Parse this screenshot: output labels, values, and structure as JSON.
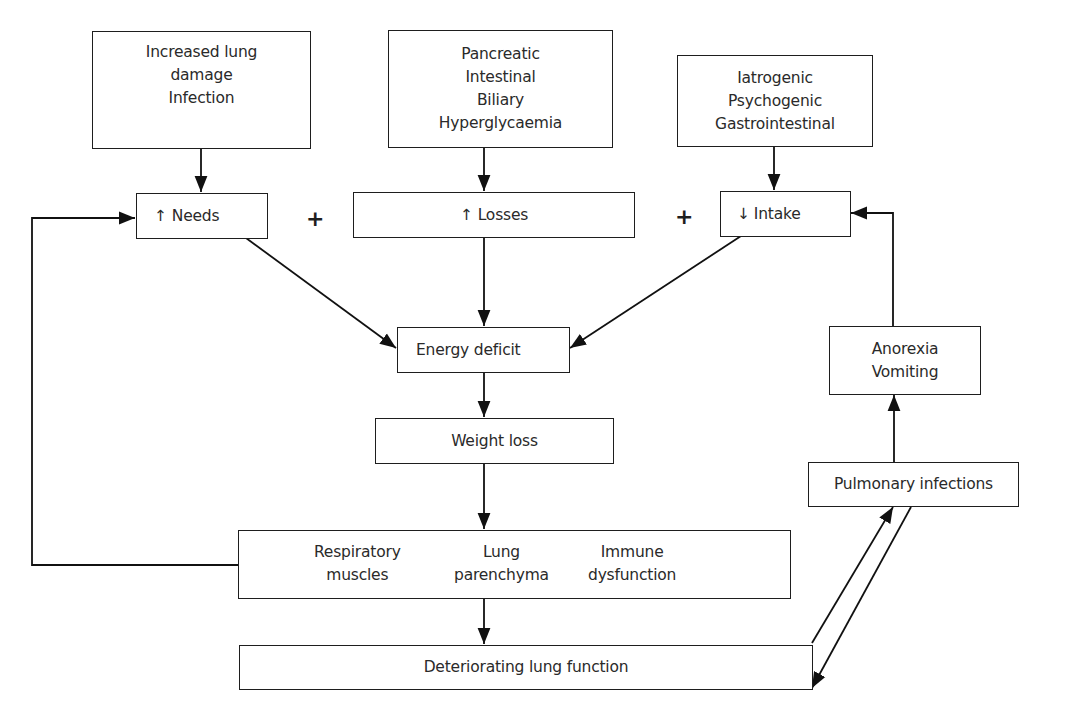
{
  "diagram": {
    "type": "flowchart",
    "nodes": {
      "lung_damage": {
        "lines": [
          "Increased lung",
          "damage",
          "Infection"
        ]
      },
      "gi_causes": {
        "lines": [
          "Pancreatic",
          "Intestinal",
          "Biliary",
          "Hyperglycaemia"
        ]
      },
      "intake_causes": {
        "lines": [
          "Iatrogenic",
          "Psychogenic",
          "Gastrointestinal"
        ]
      },
      "needs": {
        "arrow": "↑",
        "label": "Needs"
      },
      "losses": {
        "arrow": "↑",
        "label": "Losses"
      },
      "intake": {
        "arrow": "↓",
        "label": "Intake"
      },
      "energy_deficit": {
        "label": "Energy deficit"
      },
      "weight_loss": {
        "label": "Weight loss"
      },
      "anorexia": {
        "lines": [
          "Anorexia",
          "Vomiting"
        ]
      },
      "pulmonary_infections": {
        "label": "Pulmonary infections"
      },
      "effects": {
        "columns": [
          [
            "Respiratory",
            "muscles"
          ],
          [
            "Lung",
            "parenchyma"
          ],
          [
            "Immune",
            "dysfunction"
          ]
        ]
      },
      "deteriorating": {
        "label": "Deteriorating lung function"
      }
    },
    "operators": {
      "plus_1": "+",
      "plus_2": "+"
    },
    "edges": [
      [
        "lung_damage",
        "needs"
      ],
      [
        "gi_causes",
        "losses"
      ],
      [
        "intake_causes",
        "intake"
      ],
      [
        "needs",
        "energy_deficit"
      ],
      [
        "losses",
        "energy_deficit"
      ],
      [
        "intake",
        "energy_deficit"
      ],
      [
        "energy_deficit",
        "weight_loss"
      ],
      [
        "weight_loss",
        "effects"
      ],
      [
        "effects",
        "deteriorating"
      ],
      [
        "effects",
        "needs"
      ],
      [
        "deteriorating",
        "pulmonary_infections"
      ],
      [
        "pulmonary_infections",
        "deteriorating"
      ],
      [
        "pulmonary_infections",
        "anorexia"
      ],
      [
        "anorexia",
        "intake"
      ]
    ]
  }
}
